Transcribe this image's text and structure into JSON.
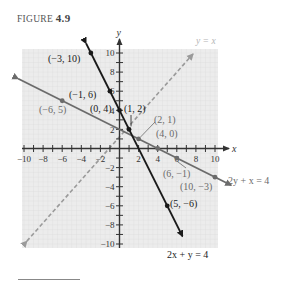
{
  "figure": {
    "label_word": "FIGURE",
    "label_number": "4.9"
  },
  "chart_data": {
    "type": "line",
    "title": "FIGURE 4.9",
    "xlabel": "x",
    "ylabel": "y",
    "xlim": [
      -10,
      10
    ],
    "ylim": [
      -10,
      10
    ],
    "grid": true,
    "x_tick_labels": [
      "-10",
      "-8",
      "-6",
      "-4",
      "-2",
      "2",
      "4",
      "6",
      "8",
      "10"
    ],
    "y_tick_labels": [
      "10",
      "8",
      "6",
      "4",
      "2",
      "-2",
      "-4",
      "-6",
      "-8",
      "-10"
    ],
    "series": [
      {
        "name": "2x + y = 4",
        "style": "solid-black",
        "color": "#1a1a1a",
        "equation": "y = 4 - 2x",
        "points": [
          {
            "x": -3,
            "y": 10,
            "label": "(−3, 10)"
          },
          {
            "x": -1,
            "y": 6,
            "label": "(−1, 6)"
          },
          {
            "x": 0,
            "y": 4,
            "label": "(0, 4)"
          },
          {
            "x": 1,
            "y": 2,
            "label": "(1, 2)"
          },
          {
            "x": 5,
            "y": -6,
            "label": "(5, −6)"
          }
        ]
      },
      {
        "name": "2y + x = 4",
        "style": "solid-gray",
        "color": "#6b6b6b",
        "equation": "y = (4 - x)/2",
        "points": [
          {
            "x": -6,
            "y": 5,
            "label": "(−6, 5)"
          },
          {
            "x": 4,
            "y": 0,
            "label": "(4, 0)"
          },
          {
            "x": 6,
            "y": -1,
            "label": "(6, −1)"
          },
          {
            "x": 10,
            "y": -3,
            "label": "(10, −3)"
          }
        ]
      },
      {
        "name": "y = x",
        "style": "dashed-gray",
        "color": "#9a9a9a",
        "equation": "y = x",
        "points": []
      }
    ],
    "annotations": [
      {
        "text": "(2, 1)",
        "x": 2,
        "y": 1
      },
      {
        "text": "y = x"
      },
      {
        "text": "2y + x = 4"
      },
      {
        "text": "2x + y = 4"
      }
    ]
  }
}
